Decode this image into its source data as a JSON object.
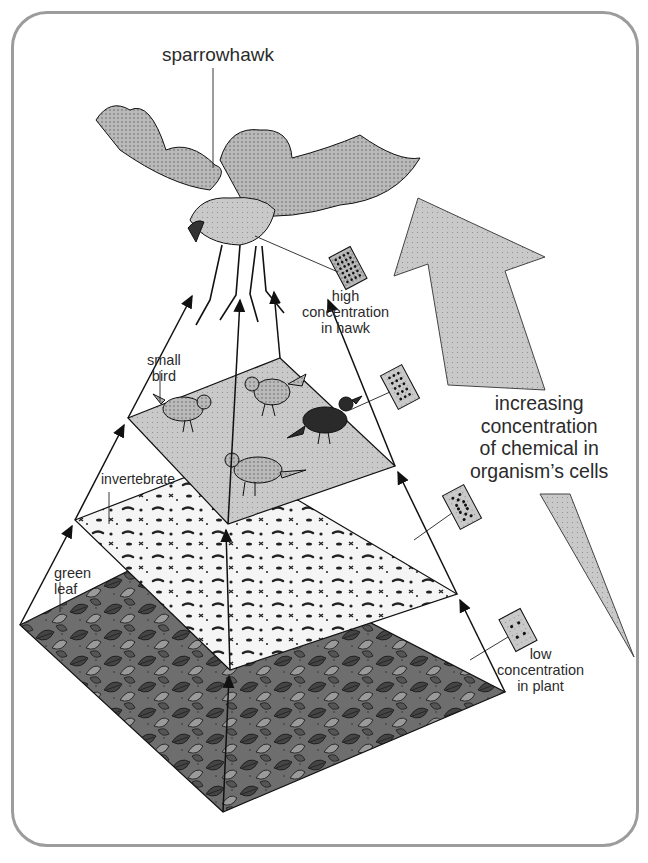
{
  "diagram": {
    "type": "food chain pyramid / biomagnification",
    "labels": {
      "top_predator": "sparrowhawk",
      "high_concentration": [
        "high",
        "concentration",
        "in hawk"
      ],
      "small_bird": [
        "small",
        "bird"
      ],
      "invertebrate": "invertebrate",
      "green_leaf": [
        "green",
        "leaf"
      ],
      "increasing": [
        "increasing",
        "concentration",
        "of chemical in",
        "organism’s cells"
      ],
      "low_concentration": [
        "low",
        "concentration",
        "in plant"
      ]
    },
    "levels": [
      {
        "name": "green leaf",
        "concentration_dots": 4,
        "fill": "#555555"
      },
      {
        "name": "invertebrate",
        "concentration_dots": 12,
        "fill": "#f4f4f4"
      },
      {
        "name": "small bird",
        "concentration_dots": 20,
        "fill": "#c8c8c8"
      },
      {
        "name": "sparrowhawk",
        "concentration_dots": 36,
        "fill": "#b8b8b8"
      }
    ],
    "colors": {
      "border": "#9c9c9c",
      "arrow_fill": "#bcbcbc",
      "line": "#1a1a1a",
      "cell_card": "#b0b0b0"
    }
  }
}
